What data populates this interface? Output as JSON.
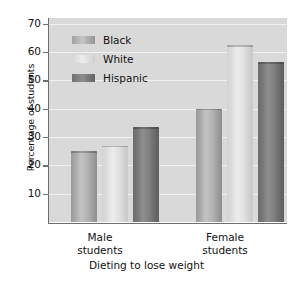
{
  "chart_data": {
    "type": "bar",
    "title": "",
    "xlabel": "Dieting to lose weight",
    "ylabel": "Percentage of students",
    "categories": [
      "Male students",
      "Female students"
    ],
    "category_lines": [
      [
        "Male",
        "students"
      ],
      [
        "Female",
        "students"
      ]
    ],
    "series": [
      {
        "name": "Black",
        "values": [
          25,
          40
        ]
      },
      {
        "name": "White",
        "values": [
          27,
          62.5
        ]
      },
      {
        "name": "Hispanic",
        "values": [
          33.5,
          56.5
        ]
      }
    ],
    "ylim": [
      0,
      72
    ],
    "yticks": [
      10,
      20,
      30,
      40,
      50,
      60,
      70
    ],
    "ytick_labels": [
      "10",
      "20",
      "30",
      "40",
      "50",
      "60",
      "70"
    ],
    "grid": true,
    "legend_position": "upper-left-inside",
    "plot_background": "#d9d9d9",
    "gridline_color": "#f1f1f1",
    "series_colors": {
      "Black": "#b4b4b4",
      "White": "#e2e2e2",
      "Hispanic": "#7f7f7f"
    }
  },
  "legend": {
    "items": [
      {
        "label": "Black",
        "swatch": "black"
      },
      {
        "label": "White",
        "swatch": "white"
      },
      {
        "label": "Hispanic",
        "swatch": "hispanic"
      }
    ]
  },
  "axes": {
    "y_title": "Percentage of students",
    "x_title": "Dieting to lose weight"
  }
}
